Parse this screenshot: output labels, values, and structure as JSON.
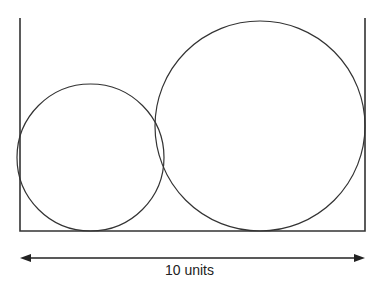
{
  "diagram": {
    "box": {
      "left": 20,
      "right": 365,
      "top": 18,
      "bottom": 231
    },
    "circles": [
      {
        "name": "small-circle",
        "cx": 90.5,
        "cy": 157.5,
        "r": 73.5
      },
      {
        "name": "large-circle",
        "cx": 260,
        "cy": 126,
        "r": 105
      }
    ],
    "dimension": {
      "label": "10 units",
      "y": 258,
      "x1": 20,
      "x2": 365
    },
    "stroke_color": "#333333"
  }
}
